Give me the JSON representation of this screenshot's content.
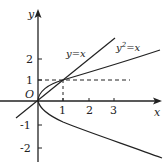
{
  "diagram": {
    "type": "function-graph",
    "axes": {
      "x_label": "x",
      "y_label": "y",
      "origin_label": "O",
      "x_ticks": [
        "1",
        "2",
        "3"
      ],
      "y_ticks_positive": [
        "1",
        "2"
      ],
      "y_ticks_negative": [
        "-1",
        "-2"
      ]
    },
    "curves": [
      {
        "name": "line",
        "label": "y=x"
      },
      {
        "name": "parabola",
        "label_base": "y",
        "label_exp": "2",
        "label_rest": "=x"
      }
    ],
    "intersection_guides": {
      "x": "1",
      "y": "1"
    },
    "colors": {
      "ink": "#222222",
      "background": "#ffffff"
    }
  }
}
